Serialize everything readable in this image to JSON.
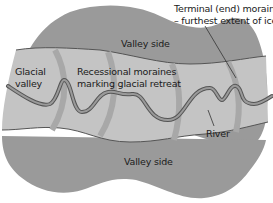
{
  "diagram": {
    "labels": {
      "valley_side_top": "Valley side",
      "valley_side_bottom": "Valley side",
      "glacial_valley_line1": "Glacial",
      "glacial_valley_line2": "valley",
      "recessional_line1": "Recessional moraines",
      "recessional_line2": "marking glacial retreat",
      "terminal_line1": "Terminal (end) moraine",
      "terminal_line2": "– furthest extent of ice",
      "river": "River"
    },
    "colors": {
      "valley_side": "#9a9a9a",
      "valley_floor": "#c4c4c4",
      "moraine": "#a8a8a8",
      "river_outline": "#555555",
      "river_fill": "#9a9a9a",
      "boundary_line": "#555555",
      "text": "#1a1a1a"
    }
  }
}
